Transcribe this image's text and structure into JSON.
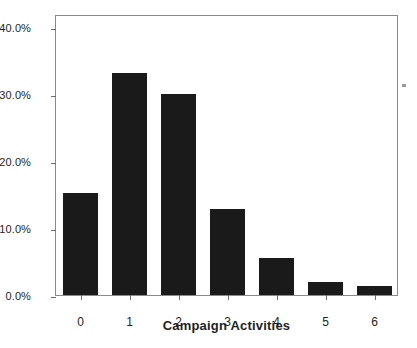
{
  "chart_data": {
    "type": "bar",
    "title": "",
    "subtitle": "",
    "xlabel": "Campaign Activities",
    "ylabel": "",
    "categories": [
      "0",
      "1",
      "2",
      "3",
      "4",
      "5",
      "6"
    ],
    "values": [
      15.3,
      33.2,
      30.0,
      12.9,
      5.6,
      2.0,
      1.4
    ],
    "value_labels": [
      "15.3%",
      "33.2%",
      "30.0%",
      "12.9%",
      "5.6%",
      "2.0%",
      "1.4%"
    ],
    "ylim": [
      0,
      42
    ],
    "xlim": [
      -0.5,
      6.5
    ],
    "y_ticks": [
      0,
      10,
      20,
      30,
      40
    ],
    "y_tick_labels": [
      "0.0%",
      "10.0%",
      "20.0%",
      "30.0%",
      "40.0%"
    ],
    "x_tick_labels": [
      "0",
      "1",
      "2",
      "3",
      "4",
      "5",
      "6"
    ],
    "grid": false,
    "legend": null,
    "legend_position": "none",
    "bar_color": "#1a1a1a",
    "axis_color": "#8a8a8a",
    "text_color": "#231f20",
    "background_color": "#ffffff"
  }
}
